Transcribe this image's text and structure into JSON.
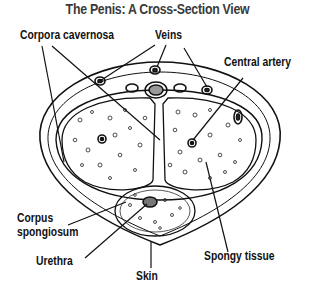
{
  "title": "The Penis: A Cross-Section View",
  "labels": {
    "corpora_cavernosa": "Corpora cavernosa",
    "veins": "Veins",
    "central_artery": "Central artery",
    "corpus_spongiosum_line1": "Corpus",
    "corpus_spongiosum_line2": "spongiosum",
    "urethra": "Urethra",
    "skin": "Skin",
    "spongy_tissue": "Spongy tissue"
  },
  "colors": {
    "ink": "#111111",
    "title": "#3a3a3a",
    "background": "#ffffff"
  }
}
